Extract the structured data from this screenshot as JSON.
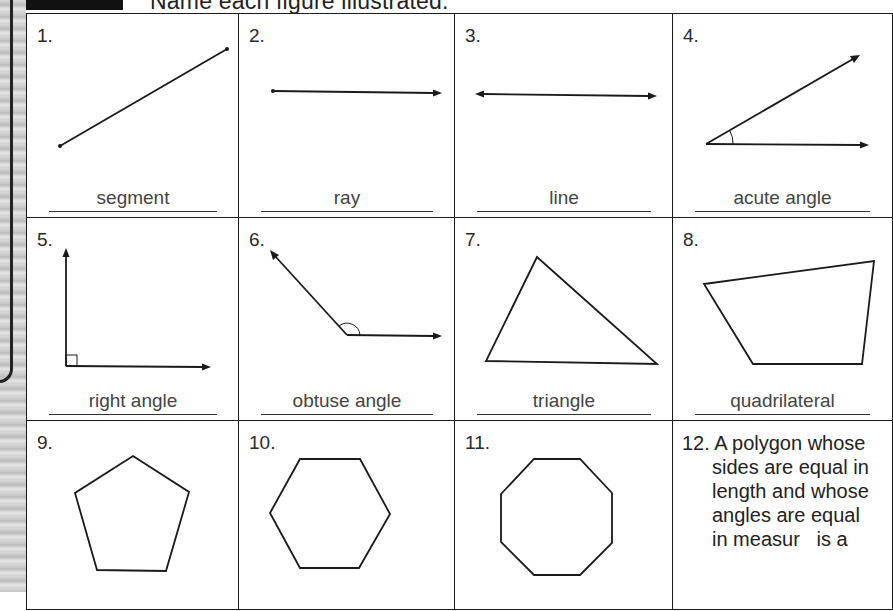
{
  "header": {
    "instruction": "Name each figure illustrated."
  },
  "cells": [
    {
      "number": "1.",
      "figure": "segment-figure",
      "answer": "segment"
    },
    {
      "number": "2.",
      "figure": "ray-figure",
      "answer": "ray"
    },
    {
      "number": "3.",
      "figure": "line-figure",
      "answer": "line"
    },
    {
      "number": "4.",
      "figure": "acute-angle-figure",
      "answer": "acute angle"
    },
    {
      "number": "5.",
      "figure": "right-angle-figure",
      "answer": "right angle"
    },
    {
      "number": "6.",
      "figure": "obtuse-angle-figure",
      "answer": "obtuse angle"
    },
    {
      "number": "7.",
      "figure": "triangle-figure",
      "answer": "triangle"
    },
    {
      "number": "8.",
      "figure": "quadrilateral-figure",
      "answer": "quadrilateral"
    },
    {
      "number": "9.",
      "figure": "pentagon-figure",
      "answer": ""
    },
    {
      "number": "10.",
      "figure": "hexagon-figure",
      "answer": ""
    },
    {
      "number": "11.",
      "figure": "octagon-figure",
      "answer": ""
    }
  ],
  "question12": {
    "number": "12.",
    "lines": [
      "A polygon whose",
      "sides are equal in",
      "length and whose",
      "angles are equal",
      "in measur   is a"
    ]
  },
  "colors": {
    "ink": "#1a1a1a",
    "answer_text": "#444444",
    "binding": "#cfcfcf"
  }
}
